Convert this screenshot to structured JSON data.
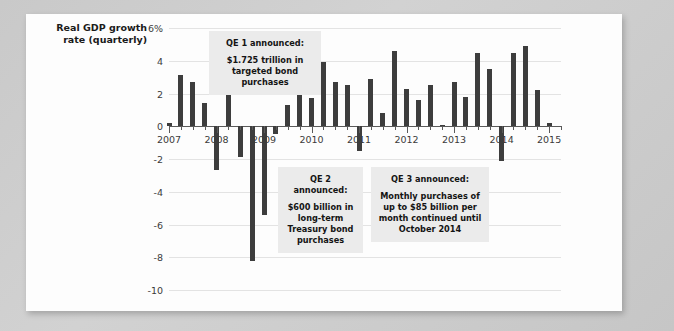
{
  "chart_data": {
    "type": "bar",
    "title": "",
    "subtitle": "",
    "ylabel": "Real GDP growth rate (quarterly)",
    "xlabel": "",
    "ylim": [
      -10,
      6
    ],
    "xlim": [
      2007.0,
      2015.25
    ],
    "grid": true,
    "legend": null,
    "yticks": [
      "6%",
      "4",
      "2",
      "0",
      "-2",
      "-4",
      "-6",
      "-8",
      "-10"
    ],
    "ytick_values": [
      6,
      4,
      2,
      0,
      -2,
      -4,
      -6,
      -8,
      -10
    ],
    "xticks": [
      "2007",
      "2008",
      "2009",
      "2010",
      "2011",
      "2012",
      "2013",
      "2014",
      "2015"
    ],
    "xtick_values": [
      2007,
      2008,
      2009,
      2010,
      2011,
      2012,
      2013,
      2014,
      2015
    ],
    "bar_color": "#3d3d3d",
    "categories": [
      "2007 Q1",
      "2007 Q2",
      "2007 Q3",
      "2007 Q4",
      "2008 Q1",
      "2008 Q2",
      "2008 Q3",
      "2008 Q4",
      "2009 Q1",
      "2009 Q2",
      "2009 Q3",
      "2009 Q4",
      "2010 Q1",
      "2010 Q2",
      "2010 Q3",
      "2010 Q4",
      "2011 Q1",
      "2011 Q2",
      "2011 Q3",
      "2011 Q4",
      "2012 Q1",
      "2012 Q2",
      "2012 Q3",
      "2012 Q4",
      "2013 Q1",
      "2013 Q2",
      "2013 Q3",
      "2013 Q4",
      "2014 Q1",
      "2014 Q2",
      "2014 Q3",
      "2014 Q4",
      "2015 Q1"
    ],
    "x": [
      2007.0,
      2007.25,
      2007.5,
      2007.75,
      2008.0,
      2008.25,
      2008.5,
      2008.75,
      2009.0,
      2009.25,
      2009.5,
      2009.75,
      2010.0,
      2010.25,
      2010.5,
      2010.75,
      2011.0,
      2011.25,
      2011.5,
      2011.75,
      2012.0,
      2012.25,
      2012.5,
      2012.75,
      2013.0,
      2013.25,
      2013.5,
      2013.75,
      2014.0,
      2014.25,
      2014.5,
      2014.75,
      2015.0
    ],
    "values": [
      0.2,
      3.1,
      2.7,
      1.4,
      -2.7,
      2.0,
      -1.9,
      -8.2,
      -5.4,
      -0.5,
      1.3,
      3.9,
      1.7,
      3.9,
      2.7,
      2.5,
      -1.5,
      2.9,
      0.8,
      4.6,
      2.3,
      1.6,
      2.5,
      0.1,
      2.7,
      1.8,
      4.5,
      3.5,
      -2.1,
      4.5,
      4.9,
      2.2,
      0.2
    ]
  },
  "annotations": [
    {
      "id": "qe1",
      "heading": "QE 1 announced:",
      "body": "$1.725 trillion in targeted bond purchases"
    },
    {
      "id": "qe2",
      "heading": "QE 2 announced:",
      "body": "$600 billion in long-term Treasury bond purchases"
    },
    {
      "id": "qe3",
      "heading": "QE 3 announced:",
      "body": "Monthly purchases of up to $85 billion per month continued until October 2014"
    }
  ]
}
